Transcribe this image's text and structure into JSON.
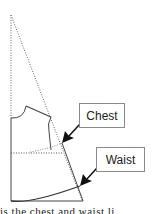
{
  "diagram": {
    "type": "pattern-drafting",
    "labels": {
      "chest": "Chest",
      "waist": "Waist"
    },
    "caption": "is the chest and waist li"
  },
  "colors": {
    "line": "#555555",
    "arrow": "#111111",
    "box_border": "#8a8a8a"
  }
}
